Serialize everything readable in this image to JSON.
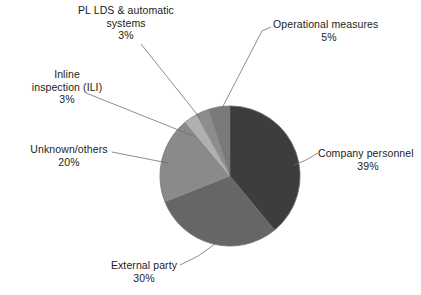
{
  "chart_data": {
    "type": "pie",
    "title": "",
    "subtitle": "",
    "xlabel": "",
    "ylabel": "",
    "legend_position": "none",
    "labels_position": "outside-with-leader-lines",
    "grid": false,
    "units": "percent",
    "total": 100,
    "categories": [
      "Company personnel",
      "External party",
      "Unknown/others",
      "Inline inspection (ILI)",
      "PL LDS & automatic systems",
      "Operational measures"
    ],
    "values": [
      39,
      30,
      20,
      3,
      3,
      5
    ],
    "value_labels": [
      "39%",
      "30%",
      "20%",
      "3%",
      "3%",
      "5%"
    ],
    "colors": [
      "#3d3d3d",
      "#666666",
      "#8a8a8a",
      "#b0b0b0",
      "#8d8d8d",
      "#7a7a7a"
    ],
    "slices": [
      {
        "name": "Company personnel",
        "value": 39,
        "value_label": "39%",
        "color": "#3d3d3d",
        "start_angle": 0,
        "end_angle": 140.4
      },
      {
        "name": "External party",
        "value": 30,
        "value_label": "30%",
        "color": "#666666",
        "start_angle": 140.4,
        "end_angle": 248.4
      },
      {
        "name": "Unknown/others",
        "value": 20,
        "value_label": "20%",
        "color": "#8a8a8a",
        "start_angle": 248.4,
        "end_angle": 320.4
      },
      {
        "name": "Inline inspection (ILI)",
        "value": 3,
        "value_label": "3%",
        "color": "#b0b0b0",
        "start_angle": 320.4,
        "end_angle": 331.2
      },
      {
        "name": "PL LDS & automatic systems",
        "value": 3,
        "value_label": "3%",
        "color": "#8d8d8d",
        "start_angle": 331.2,
        "end_angle": 342.0
      },
      {
        "name": "Operational measures",
        "value": 5,
        "value_label": "5%",
        "color": "#7a7a7a",
        "start_angle": 342.0,
        "end_angle": 360.0
      }
    ]
  },
  "callouts": {
    "pl_lds": {
      "line1": "PL LDS & automatic",
      "line2": "systems",
      "value": "3%"
    },
    "operational_measures": {
      "name": "Operational measures",
      "value": "5%"
    },
    "inline_inspection": {
      "line1": "Inline",
      "line2": "inspection (ILI)",
      "value": "3%"
    },
    "unknown_others": {
      "name": "Unknown/others",
      "value": "20%"
    },
    "company_personnel": {
      "name": "Company personnel",
      "value": "39%"
    },
    "external_party": {
      "name": "External party",
      "value": "30%"
    }
  },
  "style": {
    "background": "#ffffff",
    "text_color": "#1c1c1c",
    "leader_line_color": "#707070"
  }
}
